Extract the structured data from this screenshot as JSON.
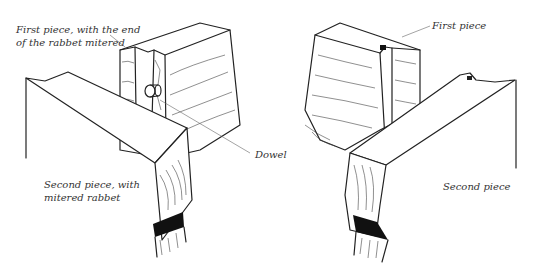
{
  "figure": {
    "left_joint": {
      "labels": {
        "first_piece": "First piece, with the end",
        "first_piece_line2": "of the rabbet mitered",
        "dowel": "Dowel",
        "second_piece": "Second piece, with",
        "second_piece_line2": "mitered rabbet"
      }
    },
    "right_joint": {
      "labels": {
        "first_piece": "First piece",
        "second_piece": "Second piece"
      }
    }
  }
}
